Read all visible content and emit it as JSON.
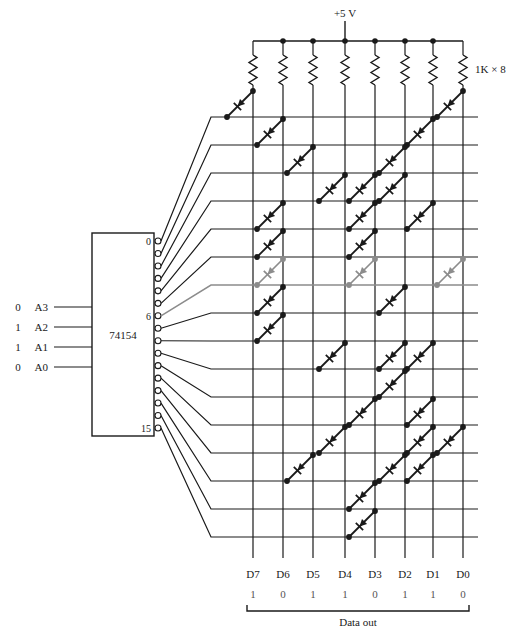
{
  "figure": {
    "supply_label": "+5 V",
    "resistor_label": "1K × 8",
    "decoder_label": "74154",
    "data_out_label": "Data out"
  },
  "address_inputs": [
    {
      "name": "A3",
      "value": "0"
    },
    {
      "name": "A2",
      "value": "1"
    },
    {
      "name": "A1",
      "value": "1"
    },
    {
      "name": "A0",
      "value": "0"
    }
  ],
  "decoder": {
    "name": "74154",
    "pin_labels": [
      {
        "index": 0,
        "label": "0"
      },
      {
        "index": 6,
        "label": "6"
      },
      {
        "index": 15,
        "label": "15"
      }
    ],
    "output_count": 16,
    "active_output": 6
  },
  "data_bus": {
    "columns": [
      {
        "name": "D7",
        "value": "1"
      },
      {
        "name": "D6",
        "value": "0"
      },
      {
        "name": "D5",
        "value": "1"
      },
      {
        "name": "D4",
        "value": "1"
      },
      {
        "name": "D3",
        "value": "0"
      },
      {
        "name": "D2",
        "value": "1"
      },
      {
        "name": "D1",
        "value": "1"
      },
      {
        "name": "D0",
        "value": "0"
      }
    ]
  },
  "colors": {
    "wire": "#1a1a1a",
    "active_row": "#8c8c8c",
    "active_diode": "#8c8c8c",
    "bit_value": "#555555",
    "background": "#ffffff"
  },
  "matrix": {
    "note": "rows are decoder outputs 0-15; each entry lists the data columns (D7..D0 index 0..7) carrying a diode",
    "rows": [
      {
        "row": 0,
        "diode_columns": [
          0,
          7
        ]
      },
      {
        "row": 1,
        "diode_columns": [
          1,
          6
        ]
      },
      {
        "row": 2,
        "diode_columns": [
          2,
          5
        ]
      },
      {
        "row": 3,
        "diode_columns": [
          3,
          4,
          5
        ]
      },
      {
        "row": 4,
        "diode_columns": [
          1,
          4,
          6
        ]
      },
      {
        "row": 5,
        "diode_columns": [
          1,
          4
        ]
      },
      {
        "row": 6,
        "diode_columns": [
          1,
          4,
          7
        ]
      },
      {
        "row": 7,
        "diode_columns": [
          1,
          5
        ]
      },
      {
        "row": 8,
        "diode_columns": [
          1
        ]
      },
      {
        "row": 9,
        "diode_columns": [
          3,
          5,
          6
        ]
      },
      {
        "row": 10,
        "diode_columns": [
          5
        ]
      },
      {
        "row": 11,
        "diode_columns": [
          4,
          6
        ]
      },
      {
        "row": 12,
        "diode_columns": [
          3,
          6,
          7
        ]
      },
      {
        "row": 13,
        "diode_columns": [
          2,
          5,
          6
        ]
      },
      {
        "row": 14,
        "diode_columns": [
          4
        ]
      },
      {
        "row": 15,
        "diode_columns": [
          4
        ]
      }
    ]
  },
  "geometry": {
    "note": "pixel coordinates used to lay out the schematic",
    "column_x": [
      253,
      283,
      313,
      345,
      375,
      405,
      433,
      463
    ],
    "row_y": [
      117,
      145,
      173,
      201,
      229,
      257,
      285,
      313,
      341,
      369,
      397,
      425,
      453,
      481,
      509,
      537
    ],
    "rail_y": 41,
    "resistor_top_y": 55,
    "resistor_bottom_y": 85,
    "matrix_left_x": 233,
    "matrix_right_x": 478,
    "decoder_box": {
      "x": 92,
      "y": 233,
      "w": 62,
      "h": 203
    },
    "pin_x": 158,
    "bus_label_y": 578,
    "bit_value_y": 598,
    "bracket_y": 612
  }
}
